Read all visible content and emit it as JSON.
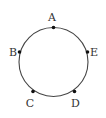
{
  "diagram": {
    "type": "circle-with-points",
    "circle": {
      "cx": 53.5,
      "cy": 62,
      "r": 34.5,
      "stroke": "#444444"
    },
    "points": [
      {
        "name": "A",
        "x": 53.5,
        "y": 27.5,
        "label_x": 52,
        "label_y": 21,
        "anchor": "middle"
      },
      {
        "name": "B",
        "x": 19.5,
        "y": 52,
        "label_x": 13,
        "label_y": 56,
        "anchor": "middle"
      },
      {
        "name": "E",
        "x": 87.5,
        "y": 52,
        "label_x": 94,
        "label_y": 56,
        "anchor": "middle"
      },
      {
        "name": "C",
        "x": 33,
        "y": 91.5,
        "label_x": 30,
        "label_y": 107,
        "anchor": "middle"
      },
      {
        "name": "D",
        "x": 74.5,
        "y": 91.5,
        "label_x": 75.5,
        "label_y": 107,
        "anchor": "middle"
      }
    ],
    "point_color": "#111111"
  }
}
